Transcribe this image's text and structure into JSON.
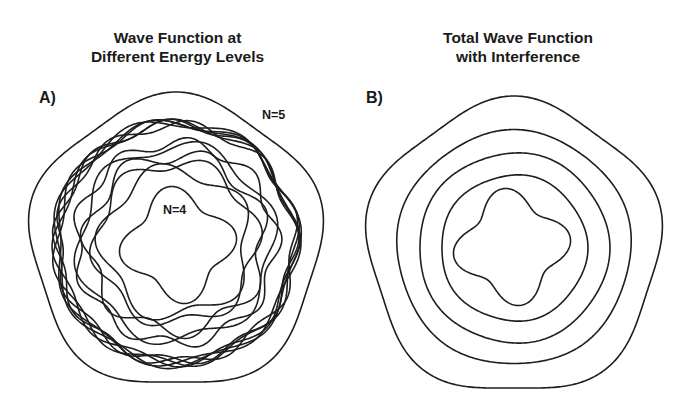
{
  "panels": [
    {
      "id": "A",
      "title_lines": [
        "Wave Function at",
        "Different Energy Levels"
      ],
      "label": "A)",
      "annotations": [
        {
          "text": "N=5",
          "refers_to": "outer 5-lobed wave"
        },
        {
          "text": "N=4",
          "refers_to": "inner 4-lobed wave"
        }
      ],
      "description": "Overlapping wavy orbit curves for individual energy levels"
    },
    {
      "id": "B",
      "title_lines": [
        "Total Wave Function",
        "with Interference"
      ],
      "label": "B)",
      "description": "Concentric rings: outer 5-lobed curve, three near-circular rings, inner 4-lobed curve"
    }
  ],
  "colors": {
    "line": "#1e1e1e",
    "background": "#ffffff"
  }
}
